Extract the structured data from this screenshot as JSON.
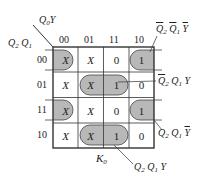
{
  "diagram": {
    "type": "karnaugh-map",
    "title": "K0",
    "row_variables": "Q2 Q1",
    "col_variables": "Q0 Y",
    "col_headers": [
      "00",
      "01",
      "11",
      "10"
    ],
    "row_headers": [
      "00",
      "01",
      "11",
      "10"
    ],
    "cells": [
      [
        "X",
        "X",
        "0",
        "1"
      ],
      [
        "X",
        "X",
        "1",
        "0"
      ],
      [
        "X",
        "X",
        "0",
        "1"
      ],
      [
        "X",
        "X",
        "1",
        "0"
      ]
    ],
    "groups": [
      {
        "name": "not-Q2 not-Q1 not-Y",
        "cells": [
          [
            0,
            0
          ],
          [
            0,
            3
          ]
        ],
        "label": "Q̄2 Q̄1 Ȳ"
      },
      {
        "name": "not-Q2 Q1 Y",
        "cells": [
          [
            1,
            1
          ],
          [
            1,
            2
          ]
        ],
        "label": "Q̄2 Q1 Y"
      },
      {
        "name": "Q2 Q1 not-Y",
        "cells": [
          [
            2,
            0
          ],
          [
            2,
            3
          ]
        ],
        "label": "Q2 Q1 Ȳ"
      },
      {
        "name": "Q2 Q1 Y",
        "cells": [
          [
            3,
            1
          ],
          [
            3,
            2
          ]
        ],
        "label": "Q2 Q1 Y"
      }
    ],
    "labels": {
      "corner_top": "Q0Y",
      "corner_left": "Q2 Q1",
      "map_name": "K",
      "map_name_sub": "0"
    },
    "colors": {
      "group_fill": "#b8b8b8",
      "grid": "#333333"
    }
  }
}
